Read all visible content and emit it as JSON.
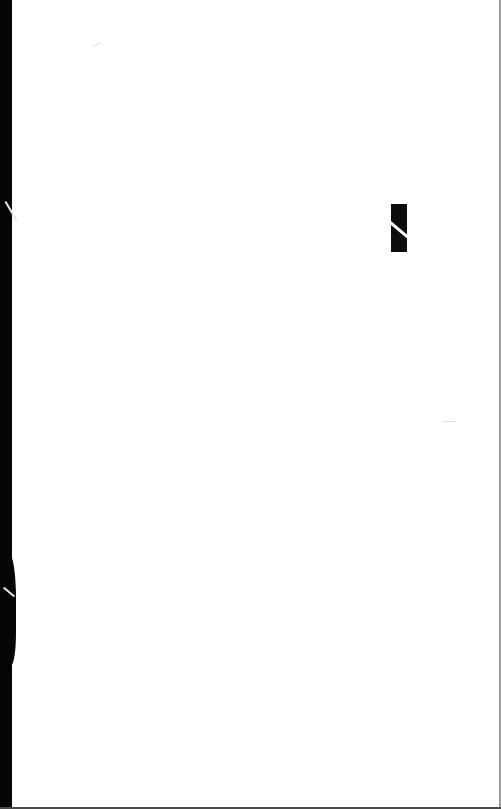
{
  "page": {
    "type": "scanned blank page",
    "background_color": "#ffffff",
    "edge_color": "#050505"
  },
  "marks": [
    {
      "name": "black-rectangle-mark",
      "color": "#0d0d0d"
    }
  ]
}
